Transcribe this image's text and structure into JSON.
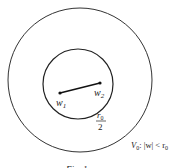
{
  "diagram": {
    "outer_circle": {
      "cx": 80,
      "cy": 80,
      "r": 72,
      "stroke": "#333333"
    },
    "inner_circle": {
      "cx": 78,
      "cy": 84,
      "r": 35,
      "stroke": "#222222"
    },
    "segment": {
      "x1": 60,
      "y1": 93,
      "x2": 100,
      "y2": 83
    },
    "points": {
      "w1": {
        "label": "w",
        "sub": "1",
        "x": 60,
        "y": 93
      },
      "w2": {
        "label": "w",
        "sub": "2",
        "x": 100,
        "y": 83
      }
    },
    "radius_label": {
      "numerator": "r",
      "numerator_sub": "0",
      "denominator": "2"
    },
    "region_label": {
      "prefix": "V",
      "prefix_sub": "0",
      "condition": ": |w| < r",
      "condition_sub": "0"
    },
    "caption": "Fig. 1"
  }
}
